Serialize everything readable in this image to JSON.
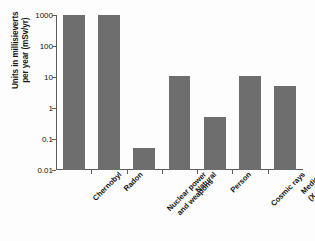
{
  "chart_data": {
    "type": "bar",
    "title": "",
    "subtitle": "",
    "xlabel": "",
    "ylabel": "Units in millisieverts\nper year (mSv/yr)",
    "yscale": "log",
    "ylim": [
      0.01,
      1000
    ],
    "grid": false,
    "legend": false,
    "bar_color": "#6e6e6e",
    "axis_color": "#5b5b5b",
    "background_color": "#fdfdfd",
    "y_ticks": [
      {
        "value": 1000,
        "label": "1000"
      },
      {
        "value": 100,
        "label": "100"
      },
      {
        "value": 10,
        "label": "10"
      },
      {
        "value": 1,
        "label": "1"
      },
      {
        "value": 0.1,
        "label": "0.1"
      },
      {
        "value": 0.01,
        "label": "0.01"
      }
    ],
    "categories": [
      "Chernobyl",
      "Radon",
      "Nuclear power\nand weapons",
      "Natural",
      "Person",
      "Cosmic rays",
      "Medical (X rays)"
    ],
    "values": [
      1000,
      1000,
      0.05,
      11,
      0.5,
      11,
      5
    ]
  }
}
